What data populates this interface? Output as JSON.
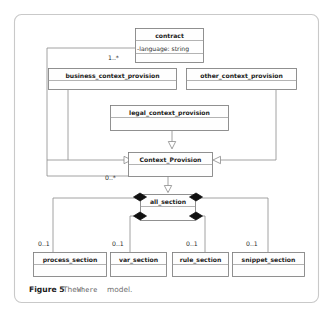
{
  "figure": {
    "caption_label": "Figure 5",
    "caption_text_before": "The",
    "caption_mono": "Where",
    "caption_text_after": "model.",
    "diagram_type": "uml-class-diagram"
  },
  "colors": {
    "page_background": "#ffffff",
    "frame_border": "#c9c9c9",
    "box_border": "#7d7d7d",
    "box_fill": "#fefefe",
    "edge_line": "#8a8a8a",
    "diamond_fill": "#111111",
    "triangle_fill": "#ffffff",
    "title_text": "#1a1a1a",
    "caption_muted": "#6f6f6f"
  },
  "classes": {
    "contract": {
      "name": "contract",
      "attribute": "-language: string"
    },
    "business_context_provision": {
      "name": "business_context_provision",
      "attribute": ""
    },
    "other_context_provision": {
      "name": "other_context_provision",
      "attribute": ""
    },
    "legal_context_provision": {
      "name": "legal_context_provision",
      "attribute": ""
    },
    "context_provision": {
      "name": "Context_Provision",
      "attribute": ""
    },
    "all_section": {
      "name": "all_section",
      "attribute": ""
    },
    "process_section": {
      "name": "process_section",
      "attribute": ""
    },
    "var_section": {
      "name": "var_section",
      "attribute": ""
    },
    "rule_section": {
      "name": "rule_section",
      "attribute": ""
    },
    "snippet_section": {
      "name": "snippet_section",
      "attribute": ""
    }
  },
  "multiplicities": {
    "contract_to_context_provision": "1..*",
    "context_provision_to_all_section": "0..*",
    "all_section_to_process_section": "0..1",
    "all_section_to_var_section": "0..1",
    "all_section_to_rule_section": "0..1",
    "all_section_to_snippet_section": "0..1"
  },
  "relationships": [
    {
      "type": "generalization",
      "from": "business_context_provision",
      "to": "Context_Provision"
    },
    {
      "type": "generalization",
      "from": "other_context_provision",
      "to": "Context_Provision"
    },
    {
      "type": "generalization",
      "from": "legal_context_provision",
      "to": "Context_Provision"
    },
    {
      "type": "generalization",
      "from": "Context_Provision",
      "to": "all_section"
    },
    {
      "type": "association",
      "from": "contract",
      "to": "Context_Provision",
      "multiplicity": "1..*"
    },
    {
      "type": "association",
      "from": "Context_Provision",
      "to": "all_section",
      "multiplicity": "0..*"
    },
    {
      "type": "composition",
      "from": "all_section",
      "to": "process_section",
      "multiplicity": "0..1"
    },
    {
      "type": "composition",
      "from": "all_section",
      "to": "var_section",
      "multiplicity": "0..1"
    },
    {
      "type": "composition",
      "from": "all_section",
      "to": "rule_section",
      "multiplicity": "0..1"
    },
    {
      "type": "composition",
      "from": "all_section",
      "to": "snippet_section",
      "multiplicity": "0..1"
    }
  ]
}
